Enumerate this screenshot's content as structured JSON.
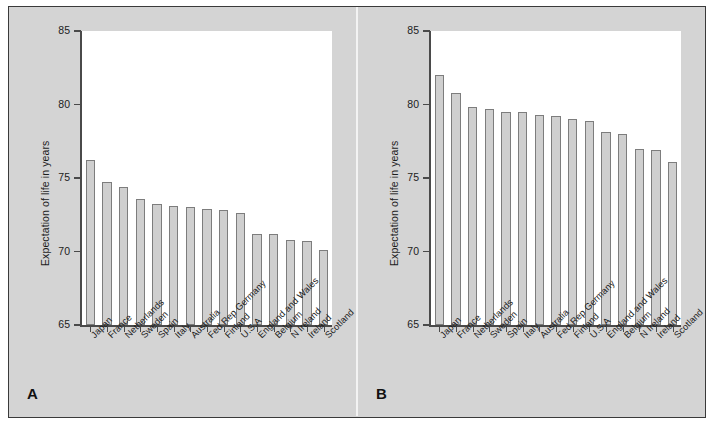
{
  "figure": {
    "background_color": "#d4d4d4",
    "border_color": "#3a3a3a",
    "bar_fill_color": "#cfcfcf",
    "bar_edge_color": "#7d7d7d",
    "plot_background_color": "#ffffff",
    "panel_a_letter": "A",
    "panel_b_letter": "B"
  },
  "chart_data": [
    {
      "type": "bar",
      "panel": "A",
      "title": "",
      "xlabel": "",
      "ylabel": "Expectation of life in years",
      "ylim": [
        65,
        85
      ],
      "yticks": [
        65,
        70,
        75,
        80,
        85
      ],
      "ytick_labels": [
        "65",
        "70",
        "75",
        "80",
        "85"
      ],
      "grid": false,
      "legend": false,
      "categories": [
        "Japan",
        "France",
        "Netherlands",
        "Sweden",
        "Spain",
        "Italy",
        "Australia",
        "Fed Rep Germany",
        "Finland",
        "U.S.A",
        "England and Wales",
        "Belgium",
        "N Ireland",
        "Ireland",
        "Scotland"
      ],
      "values": [
        76.2,
        74.7,
        74.4,
        73.6,
        73.2,
        73.1,
        73.0,
        72.9,
        72.8,
        72.6,
        71.2,
        71.2,
        70.8,
        70.7,
        70.1
      ]
    },
    {
      "type": "bar",
      "panel": "B",
      "title": "",
      "xlabel": "",
      "ylabel": "Expectation of life in years",
      "ylim": [
        65,
        85
      ],
      "yticks": [
        65,
        70,
        75,
        80,
        85
      ],
      "ytick_labels": [
        "65",
        "70",
        "75",
        "80",
        "85"
      ],
      "grid": false,
      "legend": false,
      "categories": [
        "Japan",
        "France",
        "Netherlands",
        "Sweden",
        "Spain",
        "Italy",
        "Australia",
        "Fed Rep Germany",
        "Finland",
        "U.S.A",
        "England and Wales",
        "Belgium",
        "N Ireland",
        "Ireland",
        "Scotland"
      ],
      "values": [
        82.0,
        80.8,
        79.8,
        79.7,
        79.5,
        79.5,
        79.3,
        79.2,
        79.0,
        78.9,
        78.1,
        78.0,
        77.0,
        76.9,
        76.1
      ]
    }
  ]
}
